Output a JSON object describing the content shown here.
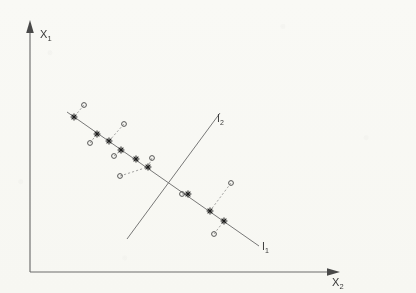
{
  "figure": {
    "background_color": "#fcfcfa",
    "ink_color": "#3a3a3a",
    "axes": {
      "vertical": {
        "label": "X",
        "subscript": "1",
        "name": "x1-axis",
        "x": 30,
        "y_top": 22,
        "y_bottom": 272,
        "arrow": "up-filled"
      },
      "horizontal": {
        "label": "X",
        "subscript": "2",
        "name": "x2-axis",
        "y": 272,
        "x_left": 30,
        "x_right": 338,
        "arrow": "right-filled"
      }
    },
    "lines": [
      {
        "id": "l1",
        "label": "I",
        "subscript": "1",
        "description": "descending projection axis carrying star markers",
        "x1": 67,
        "y1": 112,
        "x2": 259,
        "y2": 246,
        "label_x": 262,
        "label_y": 250
      },
      {
        "id": "l2",
        "label": "I",
        "subscript": "2",
        "description": "ascending discriminant line crossing l1",
        "x1": 127,
        "y1": 239,
        "x2": 220,
        "y2": 113,
        "label_x": 217,
        "label_y": 122
      }
    ],
    "intersection": {
      "x": 170,
      "y": 183
    },
    "star_points": [
      {
        "x": 74,
        "y": 117
      },
      {
        "x": 97,
        "y": 134
      },
      {
        "x": 109,
        "y": 141
      },
      {
        "x": 121,
        "y": 150
      },
      {
        "x": 136,
        "y": 159
      },
      {
        "x": 148,
        "y": 167
      },
      {
        "x": 188,
        "y": 194
      },
      {
        "x": 210,
        "y": 211
      },
      {
        "x": 224,
        "y": 221
      }
    ],
    "circle_points": [
      {
        "x": 84,
        "y": 105
      },
      {
        "x": 90,
        "y": 143
      },
      {
        "x": 124,
        "y": 124
      },
      {
        "x": 114,
        "y": 156
      },
      {
        "x": 120,
        "y": 176
      },
      {
        "x": 152,
        "y": 158
      },
      {
        "x": 182,
        "y": 194
      },
      {
        "x": 231,
        "y": 183
      },
      {
        "x": 214,
        "y": 234
      }
    ],
    "connectors": [
      {
        "from": 0,
        "to": 0
      },
      {
        "from": 1,
        "to": 1
      },
      {
        "from": 2,
        "to": 2
      },
      {
        "from": 3,
        "to": 3
      },
      {
        "from": 5,
        "to": 4
      },
      {
        "from": 5,
        "to": 5
      },
      {
        "from": 6,
        "to": 6
      },
      {
        "from": 7,
        "to": 7
      },
      {
        "from": 8,
        "to": 8
      }
    ],
    "marker_legend": {
      "circle_meaning": "original data point",
      "star_meaning": "projected point on l1"
    }
  }
}
